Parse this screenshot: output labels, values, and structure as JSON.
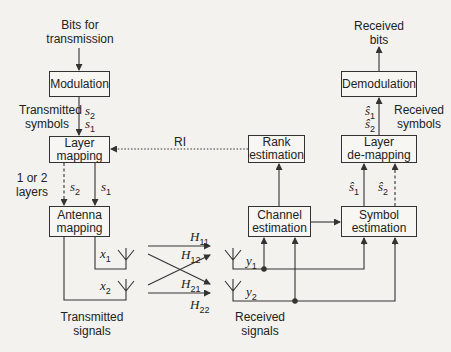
{
  "figure": {
    "type": "block-diagram"
  },
  "inputs": {
    "bits_for_transmission": "Bits for\ntransmission"
  },
  "outputs": {
    "received_bits": "Received\nbits"
  },
  "blocks": {
    "modulation": "Modulation",
    "layer_mapping": "Layer\nmapping",
    "antenna_mapping": "Antenna\nmapping",
    "rank_estimation": "Rank\nestimation",
    "channel_estimation": "Channel\nestimation",
    "symbol_estimation": "Symbol\nestimation",
    "layer_demapping": "Layer\nde-mapping",
    "demodulation": "Demodulation"
  },
  "labels": {
    "transmitted_symbols": "Transmitted\nsymbols",
    "received_symbols": "Received\nsymbols",
    "one_or_two_layers": "1 or 2\nlayers",
    "rank_indicator": "RI",
    "transmitted_signals": "Transmitted\nsignals",
    "received_signals": "Received\nsignals"
  },
  "symbols": {
    "s": "s",
    "s_hat": "ŝ",
    "x": "x",
    "y": "y",
    "H": "H",
    "sub1": "1",
    "sub2": "2",
    "sub11": "11",
    "sub12": "12",
    "sub21": "21",
    "sub22": "22"
  },
  "colors": {
    "background": "#f3f2ef",
    "line": "#333333",
    "box_fill": "#f7f6f3"
  }
}
